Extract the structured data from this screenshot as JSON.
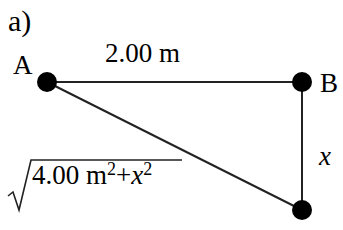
{
  "figure": {
    "part_label": "a)",
    "points": {
      "A": "A",
      "B": "B"
    },
    "top_length": "2.00 m",
    "vertical_length": "x",
    "hypotenuse": {
      "radical": "√",
      "term1": "4.00 m",
      "exp1": "2",
      "plus": "+",
      "term2": "x",
      "exp2": "2"
    }
  }
}
